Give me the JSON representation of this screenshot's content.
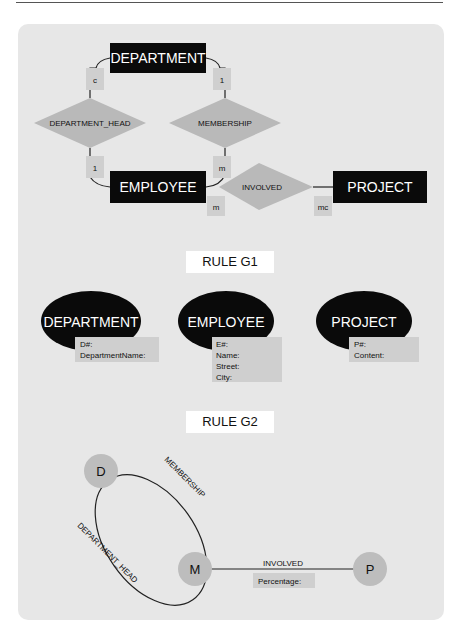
{
  "diagram1": {
    "entities": [
      {
        "name": "DEPARTMENT"
      },
      {
        "name": "EMPLOYEE"
      },
      {
        "name": "PROJECT"
      }
    ],
    "relationships": [
      {
        "name": "DEPARTMENT_HEAD"
      },
      {
        "name": "MEMBERSHIP"
      },
      {
        "name": "INVOLVED"
      }
    ],
    "cardinalities": {
      "dept_head_department": "c",
      "membership_department": "1",
      "dept_head_employee": "1",
      "membership_employee": "m",
      "involved_employee": "m",
      "involved_project": "mc"
    }
  },
  "rule_g1": {
    "label": "RULE G1",
    "tables": [
      {
        "name": "DEPARTMENT",
        "attributes": [
          "D#:",
          "DepartmentName:"
        ]
      },
      {
        "name": "EMPLOYEE",
        "attributes": [
          "E#:",
          "Name:",
          "Street:",
          "City:"
        ]
      },
      {
        "name": "PROJECT",
        "attributes": [
          "P#:",
          "Content:"
        ]
      }
    ]
  },
  "rule_g2": {
    "label": "RULE G2",
    "nodes": {
      "d": "D",
      "m": "M",
      "p": "P"
    },
    "edges": {
      "membership": "MEMBERSHIP",
      "department_head": "DEPARTMENT_HEAD",
      "involved": "INVOLVED"
    },
    "involved_attribute": "Percentage:"
  },
  "colors": {
    "entity_fill": "#0a0a0a",
    "relationship_fill": "#b9b9b9",
    "cardinality_fill": "#cfcfcf",
    "node_fill": "#bdbdbd",
    "panel_bg": "#e7e7e7"
  }
}
